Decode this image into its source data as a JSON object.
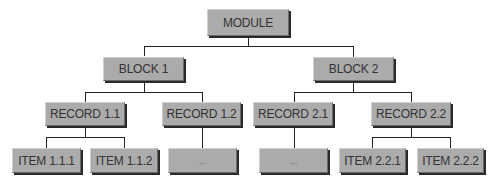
{
  "diagram": {
    "type": "hierarchy-tree",
    "root": {
      "label": "MODULE",
      "children": [
        {
          "label": "BLOCK 1",
          "children": [
            {
              "label": "RECORD 1.1",
              "children": [
                {
                  "label": "ITEM 1.1.1"
                },
                {
                  "label": "ITEM 1.1.2"
                }
              ]
            },
            {
              "label": "RECORD 1.2",
              "children": [
                {
                  "label": "..."
                }
              ]
            }
          ]
        },
        {
          "label": "BLOCK 2",
          "children": [
            {
              "label": "RECORD 2.1",
              "children": [
                {
                  "label": "..."
                }
              ]
            },
            {
              "label": "RECORD 2.2",
              "children": [
                {
                  "label": "ITEM 2.2.1"
                },
                {
                  "label": "ITEM 2.2.2"
                }
              ]
            }
          ]
        }
      ]
    },
    "colors": {
      "node_fill": "#ababab",
      "node_text": "#333333",
      "connector": "#222222",
      "shadow": "#2a2a2a",
      "background": "#ffffff"
    }
  },
  "nodes": {
    "module": "MODULE",
    "block1": "BLOCK 1",
    "block2": "BLOCK 2",
    "record11": "RECORD 1.1",
    "record12": "RECORD 1.2",
    "record21": "RECORD 2.1",
    "record22": "RECORD 2.2",
    "item111": "ITEM 1.1.1",
    "item112": "ITEM 1.1.2",
    "item12x": "...",
    "item21x": "...",
    "item221": "ITEM 2.2.1",
    "item222": "ITEM 2.2.2"
  }
}
